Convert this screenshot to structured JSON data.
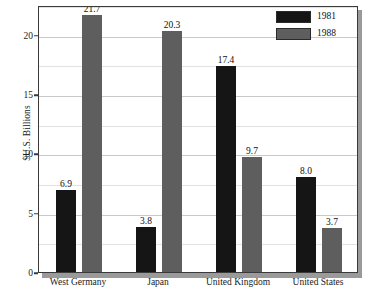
{
  "chart_data": {
    "type": "bar",
    "title": "",
    "subtitle": "",
    "xlabel": "",
    "ylabel": "$U.S. Billions",
    "ylim": [
      0,
      22.5
    ],
    "yticks": [
      0,
      5,
      10,
      15,
      20
    ],
    "ytick_labels": [
      "0",
      "5",
      "10",
      "15",
      "20"
    ],
    "minor_yticks": [
      2.5,
      7.5,
      12.5,
      17.5,
      22.5
    ],
    "grid": "horizontal",
    "legend_position": "top-right",
    "categories": [
      "West Germany",
      "Japan",
      "United Kingdom",
      "United States"
    ],
    "series": [
      {
        "name": "1981",
        "color": "#151515",
        "values": [
          6.9,
          3.8,
          17.4,
          8.0
        ],
        "labels": [
          "6.9",
          "3.8",
          "17.4",
          "8.0"
        ]
      },
      {
        "name": "1988",
        "color": "#5e5e5e",
        "values": [
          21.7,
          20.3,
          9.7,
          3.7
        ],
        "labels": [
          "21.7",
          "20.3",
          "9.7",
          "3.7"
        ]
      }
    ]
  },
  "legend": {
    "entries": [
      {
        "label": "1981",
        "swatch": "#151515"
      },
      {
        "label": "1988",
        "swatch": "#5e5e5e"
      }
    ]
  },
  "axes": {
    "y_title": "$U.S. Billions"
  }
}
